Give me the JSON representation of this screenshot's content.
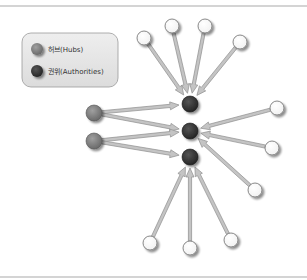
{
  "legend": {
    "items": [
      {
        "label": "허브(Hubs)",
        "kind": "hub"
      },
      {
        "label": "권위(Authorities)",
        "kind": "authority"
      }
    ]
  },
  "colors": {
    "hub": "#7a7a7a",
    "authority": "#333333",
    "page": "#ffffff",
    "arrow_fill": "#c4c4c4",
    "arrow_stroke": "#8e8e8e",
    "legend_bg": "#e6e6e6",
    "legend_border": "#9a9a9a"
  },
  "graph": {
    "nodes": [
      {
        "id": "a1",
        "kind": "authority"
      },
      {
        "id": "a2",
        "kind": "authority"
      },
      {
        "id": "a3",
        "kind": "authority"
      },
      {
        "id": "h1",
        "kind": "hub"
      },
      {
        "id": "h2",
        "kind": "hub"
      },
      {
        "id": "t1",
        "kind": "page"
      },
      {
        "id": "t2",
        "kind": "page"
      },
      {
        "id": "t3",
        "kind": "page"
      },
      {
        "id": "t4",
        "kind": "page"
      },
      {
        "id": "r1",
        "kind": "page"
      },
      {
        "id": "r2",
        "kind": "page"
      },
      {
        "id": "r3",
        "kind": "page"
      },
      {
        "id": "b1",
        "kind": "page"
      },
      {
        "id": "b2",
        "kind": "page"
      },
      {
        "id": "b3",
        "kind": "page"
      }
    ],
    "edges": [
      {
        "from": "t1",
        "to": "a1"
      },
      {
        "from": "t2",
        "to": "a1"
      },
      {
        "from": "t3",
        "to": "a1"
      },
      {
        "from": "t4",
        "to": "a1"
      },
      {
        "from": "h1",
        "to": "a1"
      },
      {
        "from": "h1",
        "to": "a2"
      },
      {
        "from": "h2",
        "to": "a2"
      },
      {
        "from": "h2",
        "to": "a3"
      },
      {
        "from": "r1",
        "to": "a2"
      },
      {
        "from": "r2",
        "to": "a2"
      },
      {
        "from": "r3",
        "to": "a2"
      },
      {
        "from": "b1",
        "to": "a3"
      },
      {
        "from": "b2",
        "to": "a3"
      },
      {
        "from": "b3",
        "to": "a3"
      }
    ]
  }
}
